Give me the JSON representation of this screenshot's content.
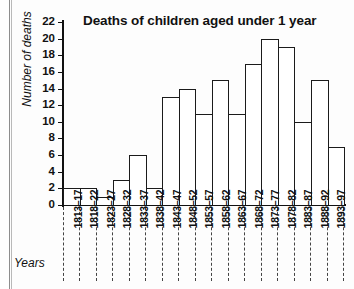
{
  "chart_data": {
    "type": "bar",
    "title": "Deaths of children aged under 1 year",
    "xlabel": "Years",
    "ylabel": "Number of deaths",
    "ylim": [
      0,
      22
    ],
    "ytick_step": 2,
    "yticks": [
      22,
      20,
      18,
      16,
      14,
      12,
      10,
      8,
      6,
      4,
      2,
      0
    ],
    "grid": false,
    "legend": null,
    "categories": [
      "1813–17",
      "1818–22",
      "1823–27",
      "1828–32",
      "1833–37",
      "1838–42",
      "1843–47",
      "1848–52",
      "1853–57",
      "1858–62",
      "1863–67",
      "1868–72",
      "1873–77",
      "1878–82",
      "1883–87",
      "1888–92",
      "1893–97"
    ],
    "values": [
      2,
      2,
      1,
      3,
      6,
      2,
      13,
      14,
      11,
      15,
      11,
      17,
      20,
      19,
      10,
      15,
      7
    ],
    "bar_fill": "#ffffff",
    "bar_stroke": "#1b1b1b",
    "axis_color": "#111111"
  }
}
